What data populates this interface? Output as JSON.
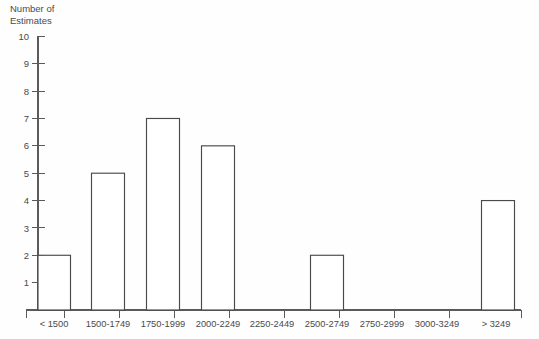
{
  "chart_data": {
    "type": "bar",
    "title": "",
    "subtitle": "",
    "xlabel": "",
    "ylabel": "Number of Estimates",
    "ylabel_lines": [
      "Number of",
      "Estimates"
    ],
    "categories": [
      "< 1500",
      "1500-1749",
      "1750-1999",
      "2000-2249",
      "2250-2449",
      "2500-2749",
      "2750-2999",
      "3000-3249",
      "> 3249"
    ],
    "values": [
      2,
      5,
      7,
      6,
      0,
      2,
      0,
      0,
      4
    ],
    "ylim": [
      0,
      10
    ],
    "ytick_labels": [
      "10",
      "9",
      "8",
      "7",
      "6",
      "5",
      "4",
      "3",
      "2",
      "1"
    ],
    "ytick_values": [
      10,
      9,
      8,
      7,
      6,
      5,
      4,
      3,
      2,
      1
    ],
    "grid": false,
    "legend": false,
    "legend_position": "none",
    "colors": {
      "bar_fill": "#ffffff",
      "bar_stroke": "#4a4a4a",
      "axis": "#5a5a5a",
      "text": "#4a4a4a",
      "background": "#fefefe"
    }
  }
}
